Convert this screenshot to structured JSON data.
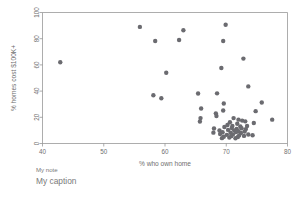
{
  "chart_data": {
    "type": "scatter",
    "title": "",
    "xlabel": "% who own home",
    "ylabel": "% homes cost $100K+",
    "xlim": [
      40,
      80
    ],
    "ylim": [
      0,
      100
    ],
    "xticks": [
      40,
      50,
      60,
      70,
      80
    ],
    "yticks": [
      0,
      20,
      40,
      60,
      80,
      100
    ],
    "xtick_labels": [
      "40",
      "50",
      "60",
      "70",
      "80"
    ],
    "ytick_labels": [
      "0",
      "20",
      "40",
      "60",
      "80",
      "100"
    ],
    "grid": false,
    "legend": "none",
    "marker_color": "#6b6b70",
    "marker_size": 4.4,
    "note": "My note",
    "caption": "My caption",
    "points": [
      [
        42.9,
        62.0
      ],
      [
        55.9,
        89.0
      ],
      [
        58.4,
        78.3
      ],
      [
        62.3,
        79.0
      ],
      [
        63.0,
        86.5
      ],
      [
        69.9,
        90.7
      ],
      [
        69.5,
        78.3
      ],
      [
        72.8,
        64.8
      ],
      [
        69.2,
        57.6
      ],
      [
        60.2,
        54.0
      ],
      [
        73.6,
        43.6
      ],
      [
        58.1,
        36.8
      ],
      [
        59.4,
        34.5
      ],
      [
        65.4,
        38.2
      ],
      [
        68.5,
        38.3
      ],
      [
        75.8,
        31.3
      ],
      [
        69.6,
        30.5
      ],
      [
        65.9,
        26.7
      ],
      [
        69.5,
        25.2
      ],
      [
        74.8,
        24.7
      ],
      [
        68.3,
        23.0
      ],
      [
        68.4,
        21.0
      ],
      [
        65.8,
        19.4
      ],
      [
        65.7,
        16.8
      ],
      [
        77.5,
        18.2
      ],
      [
        74.5,
        15.7
      ],
      [
        71.2,
        19.4
      ],
      [
        72.0,
        18.2
      ],
      [
        72.6,
        17.5
      ],
      [
        73.1,
        16.9
      ],
      [
        70.6,
        16.2
      ],
      [
        71.8,
        15.1
      ],
      [
        70.2,
        14.1
      ],
      [
        71.0,
        13.4
      ],
      [
        72.3,
        13.0
      ],
      [
        73.4,
        13.4
      ],
      [
        69.7,
        12.6
      ],
      [
        70.9,
        11.8
      ],
      [
        71.7,
        11.2
      ],
      [
        72.5,
        11.6
      ],
      [
        73.2,
        11.0
      ],
      [
        70.3,
        10.4
      ],
      [
        71.3,
        10.0
      ],
      [
        72.0,
        9.4
      ],
      [
        68.9,
        9.9
      ],
      [
        69.4,
        8.6
      ],
      [
        70.7,
        8.2
      ],
      [
        71.6,
        8.8
      ],
      [
        72.4,
        8.0
      ],
      [
        73.0,
        9.2
      ],
      [
        69.0,
        7.3
      ],
      [
        70.1,
        6.6
      ],
      [
        71.1,
        7.0
      ],
      [
        72.1,
        6.2
      ],
      [
        73.6,
        6.9
      ],
      [
        74.3,
        6.3
      ],
      [
        69.6,
        5.1
      ],
      [
        70.8,
        5.6
      ],
      [
        71.9,
        5.0
      ],
      [
        72.9,
        5.8
      ],
      [
        69.3,
        4.1
      ],
      [
        70.5,
        4.5
      ],
      [
        71.5,
        4.0
      ],
      [
        67.9,
        8.3
      ],
      [
        68.0,
        11.5
      ]
    ]
  }
}
